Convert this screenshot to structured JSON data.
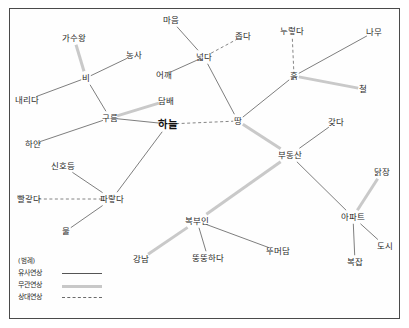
{
  "figure": {
    "center_node": "하늘",
    "legend": {
      "title": "(범례)",
      "items": [
        {
          "label": "유사연상",
          "style": "solid"
        },
        {
          "label": "무관연상",
          "style": "thick-gray"
        },
        {
          "label": "상대연상",
          "style": "dashed"
        }
      ]
    }
  },
  "nodes": [
    {
      "id": "n0",
      "label": "하늘",
      "x": 168,
      "y": 124,
      "center": true
    },
    {
      "id": "n1",
      "label": "구름",
      "x": 110,
      "y": 118
    },
    {
      "id": "n2",
      "label": "비",
      "x": 86,
      "y": 78
    },
    {
      "id": "n3",
      "label": "가수왕",
      "x": 74,
      "y": 38
    },
    {
      "id": "n4",
      "label": "농사",
      "x": 134,
      "y": 55
    },
    {
      "id": "n5",
      "label": "내리다",
      "x": 27,
      "y": 100
    },
    {
      "id": "n6",
      "label": "하얀",
      "x": 33,
      "y": 144
    },
    {
      "id": "n7",
      "label": "담배",
      "x": 166,
      "y": 101
    },
    {
      "id": "n8",
      "label": "어깨",
      "x": 164,
      "y": 75
    },
    {
      "id": "n9",
      "label": "넓다",
      "x": 204,
      "y": 57
    },
    {
      "id": "n10",
      "label": "마음",
      "x": 171,
      "y": 20
    },
    {
      "id": "n11",
      "label": "좁다",
      "x": 243,
      "y": 36
    },
    {
      "id": "n12",
      "label": "땅",
      "x": 238,
      "y": 121
    },
    {
      "id": "n13",
      "label": "흙",
      "x": 294,
      "y": 76
    },
    {
      "id": "n14",
      "label": "누렇다",
      "x": 292,
      "y": 31
    },
    {
      "id": "n15",
      "label": "나무",
      "x": 374,
      "y": 32
    },
    {
      "id": "n16",
      "label": "철",
      "x": 363,
      "y": 89
    },
    {
      "id": "n17",
      "label": "부동산",
      "x": 290,
      "y": 155
    },
    {
      "id": "n18",
      "label": "갖다",
      "x": 336,
      "y": 122
    },
    {
      "id": "n19",
      "label": "아파트",
      "x": 353,
      "y": 217
    },
    {
      "id": "n20",
      "label": "닭장",
      "x": 382,
      "y": 172
    },
    {
      "id": "n21",
      "label": "도시",
      "x": 385,
      "y": 246
    },
    {
      "id": "n22",
      "label": "복잡",
      "x": 355,
      "y": 262
    },
    {
      "id": "n23",
      "label": "복부인",
      "x": 197,
      "y": 221
    },
    {
      "id": "n24",
      "label": "뚱뚱하다",
      "x": 208,
      "y": 258
    },
    {
      "id": "n25",
      "label": "뚜머담",
      "x": 278,
      "y": 251
    },
    {
      "id": "n26",
      "label": "강남",
      "x": 141,
      "y": 259
    },
    {
      "id": "n27",
      "label": "신호등",
      "x": 63,
      "y": 166
    },
    {
      "id": "n28",
      "label": "파랗다",
      "x": 112,
      "y": 199
    },
    {
      "id": "n29",
      "label": "빨갛다",
      "x": 29,
      "y": 199
    },
    {
      "id": "n30",
      "label": "물",
      "x": 66,
      "y": 231
    }
  ],
  "edges": [
    {
      "from": "n3",
      "to": "n2",
      "style": "thick-gray"
    },
    {
      "from": "n4",
      "to": "n2",
      "style": "solid"
    },
    {
      "from": "n5",
      "to": "n2",
      "style": "solid"
    },
    {
      "from": "n2",
      "to": "n1",
      "style": "solid"
    },
    {
      "from": "n6",
      "to": "n1",
      "style": "solid"
    },
    {
      "from": "n1",
      "to": "n7",
      "style": "thick-gray"
    },
    {
      "from": "n1",
      "to": "n0",
      "style": "solid"
    },
    {
      "from": "n10",
      "to": "n9",
      "style": "solid"
    },
    {
      "from": "n9",
      "to": "n11",
      "style": "dashed"
    },
    {
      "from": "n9",
      "to": "n8",
      "style": "solid"
    },
    {
      "from": "n9",
      "to": "n12",
      "style": "solid"
    },
    {
      "from": "n0",
      "to": "n12",
      "style": "dashed"
    },
    {
      "from": "n12",
      "to": "n13",
      "style": "solid"
    },
    {
      "from": "n13",
      "to": "n14",
      "style": "dashed"
    },
    {
      "from": "n13",
      "to": "n15",
      "style": "solid"
    },
    {
      "from": "n13",
      "to": "n16",
      "style": "thick-gray"
    },
    {
      "from": "n12",
      "to": "n17",
      "style": "thick-gray"
    },
    {
      "from": "n17",
      "to": "n18",
      "style": "solid"
    },
    {
      "from": "n17",
      "to": "n19",
      "style": "solid"
    },
    {
      "from": "n19",
      "to": "n20",
      "style": "thick-gray"
    },
    {
      "from": "n19",
      "to": "n21",
      "style": "solid"
    },
    {
      "from": "n19",
      "to": "n22",
      "style": "solid"
    },
    {
      "from": "n17",
      "to": "n23",
      "style": "thick-gray"
    },
    {
      "from": "n23",
      "to": "n24",
      "style": "solid"
    },
    {
      "from": "n23",
      "to": "n25",
      "style": "solid"
    },
    {
      "from": "n23",
      "to": "n26",
      "style": "thick-gray"
    },
    {
      "from": "n0",
      "to": "n28",
      "style": "solid"
    },
    {
      "from": "n27",
      "to": "n28",
      "style": "solid"
    },
    {
      "from": "n29",
      "to": "n28",
      "style": "dashed"
    },
    {
      "from": "n28",
      "to": "n30",
      "style": "solid"
    }
  ]
}
